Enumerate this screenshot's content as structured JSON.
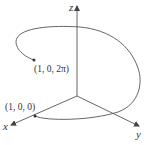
{
  "diagram": {
    "colors": {
      "line": "#555555",
      "text": "#333333",
      "background": "#ffffff"
    },
    "axes": {
      "x": {
        "label": "x"
      },
      "y": {
        "label": "y"
      },
      "z": {
        "label": "z"
      }
    },
    "points": [
      {
        "id": "start",
        "label": "(1, 0, 0)"
      },
      {
        "id": "end",
        "label": "(1, 0, 2π)"
      }
    ],
    "curve": {
      "type": "helix",
      "turns": 1
    }
  }
}
